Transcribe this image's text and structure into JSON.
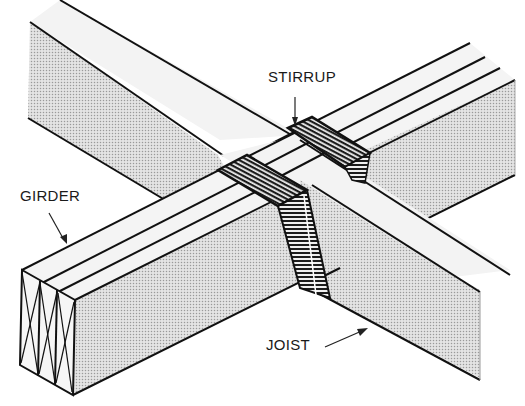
{
  "diagram": {
    "labels": {
      "stirrup": "STIRRUP",
      "girder": "GIRDER",
      "joist": "JOIST"
    },
    "components": [
      {
        "name": "girder",
        "description": "Built-up girder of three members, end grain shown with X marks"
      },
      {
        "name": "joist",
        "description": "Joist crossing over the girder"
      },
      {
        "name": "stirrup",
        "description": "Metal strap stirrups hooked over the girder supporting the joist"
      }
    ],
    "colors": {
      "line": "#111111",
      "face_shade": "#cfcfcf",
      "top_face": "#f2f2f2",
      "stirrup_fill": "#2a2a2a",
      "background": "#ffffff"
    }
  }
}
